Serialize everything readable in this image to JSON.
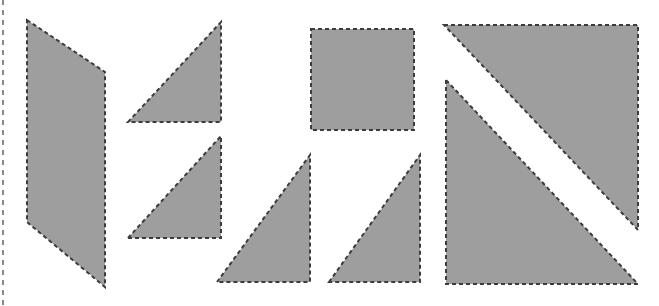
{
  "canvas": {
    "width": 659,
    "height": 306,
    "background_color": "#ffffff",
    "title": "Polygon outline figure"
  },
  "style": {
    "fill_color": "#9e9e9e",
    "stroke_color": "#3c3c3c",
    "stroke_width": 2,
    "dash_pattern": "4 3",
    "guide_color": "#888888",
    "guide_dash_pattern": "5 5",
    "guide_width": 2
  },
  "guides": [
    {
      "name": "left-edge-guide",
      "orientation": "vertical",
      "x": 3,
      "y1": 0,
      "y2": 306
    }
  ],
  "shapes": [
    {
      "id": "quadrilateral-left",
      "label": "Quadrilateral",
      "sides": 4,
      "points": "27,20 105,72 105,287 27,222"
    },
    {
      "id": "triangle-top-left-inner",
      "label": "Right triangle",
      "sides": 3,
      "points": "128,122 221,22 221,122"
    },
    {
      "id": "triangle-mid-left-inner",
      "label": "Right triangle",
      "sides": 3,
      "points": "128,238 221,136 221,238"
    },
    {
      "id": "rectangle-top-center",
      "label": "Rectangle",
      "sides": 4,
      "points": "311,29 414,29 414,130 311,130"
    },
    {
      "id": "triangle-bottom-center-left",
      "label": "Right triangle",
      "sides": 3,
      "points": "217,282 310,155 310,282"
    },
    {
      "id": "triangle-bottom-center-right",
      "label": "Right triangle",
      "sides": 3,
      "points": "329,282 420,155 420,282"
    },
    {
      "id": "triangle-large-upper-right",
      "label": "Large right triangle",
      "sides": 3,
      "points": "444,25 638,25 638,230"
    },
    {
      "id": "triangle-large-lower-left",
      "label": "Large right triangle",
      "sides": 3,
      "points": "446,80 446,284 638,284"
    }
  ]
}
